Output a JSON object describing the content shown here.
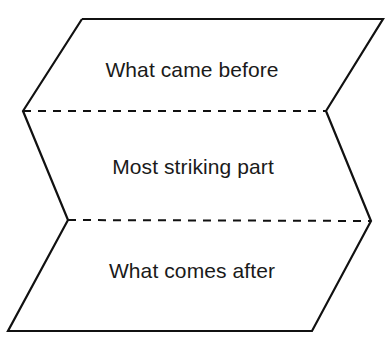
{
  "diagram": {
    "type": "folded-ribbon",
    "stroke_color": "#111111",
    "background": "#ffffff",
    "sections": [
      {
        "label": "What came before",
        "position": "top"
      },
      {
        "label": "Most striking part",
        "position": "middle"
      },
      {
        "label": "What comes after",
        "position": "bottom"
      }
    ]
  }
}
